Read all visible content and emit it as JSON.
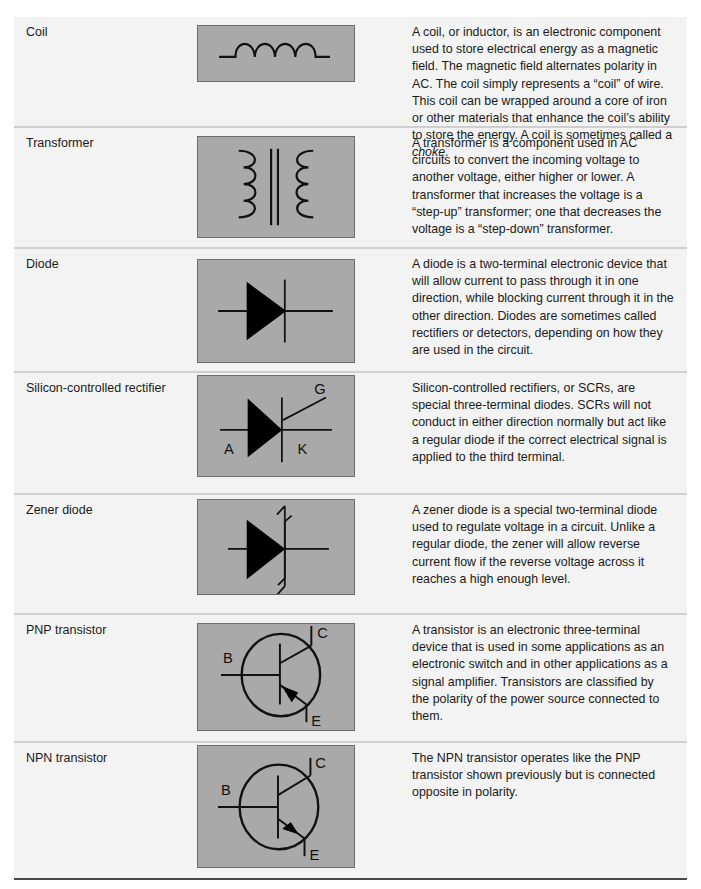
{
  "components": [
    {
      "name": "Coil",
      "symbol": "coil-symbol",
      "description_parts": [
        "A coil, or inductor, is an electronic component used to store electrical energy as a magnetic field. The magnetic field alternates polarity in AC. The coil simply represents a “coil” of wire. This coil can be wrapped around a core of iron or other materials that enhance the coil’s ability to store the energy. A coil is sometimes called a ",
        "choke",
        "."
      ]
    },
    {
      "name": "Transformer",
      "symbol": "transformer-symbol",
      "description": "A transformer is a component used in AC circuits to convert the incoming voltage to another voltage, either higher or lower. A transformer that increases the voltage is a “step-up” transformer; one that decreases the voltage is a “step-down” transformer."
    },
    {
      "name": "Diode",
      "symbol": "diode-symbol",
      "description": "A diode is a two-terminal electronic device that will allow current to pass through it in one direction, while blocking current through it in the other direction. Diodes are sometimes called rectifiers or detectors, depending on how they are used in the circuit."
    },
    {
      "name": "Silicon-controlled rectifier",
      "symbol": "scr-symbol",
      "labels": {
        "gate": "G",
        "anode": "A",
        "cathode": "K"
      },
      "description": "Silicon-controlled rectifiers, or SCRs, are special three-terminal diodes. SCRs will not conduct in either direction normally but act like a regular diode if the correct electrical signal is applied to the third terminal."
    },
    {
      "name": "Zener diode",
      "symbol": "zener-diode-symbol",
      "description": "A zener diode is a special two-terminal diode used to regulate voltage in a circuit. Unlike a regular diode, the zener will allow reverse current flow if the reverse voltage across it reaches a high enough level."
    },
    {
      "name": "PNP transistor",
      "symbol": "pnp-transistor-symbol",
      "labels": {
        "base": "B",
        "collector": "C",
        "emitter": "E"
      },
      "description": "A transistor is an electronic three-terminal device that is used in some applications as an electronic switch and in other applications as a signal amplifier. Transistors are classified by the polarity of the power source connected to them."
    },
    {
      "name": "NPN transistor",
      "symbol": "npn-transistor-symbol",
      "labels": {
        "base": "B",
        "collector": "C",
        "emitter": "E"
      },
      "description": "The NPN transistor operates like the PNP transistor shown previously but is connected opposite in polarity."
    }
  ],
  "colors": {
    "row_background": "#f3f3f3",
    "symbol_background": "#a9a9a9",
    "symbol_border": "#6d6d6d",
    "row_divider": "#cfcfcf",
    "bottom_rule": "#4a4a4a"
  }
}
